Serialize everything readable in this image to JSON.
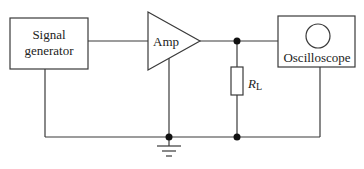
{
  "diagram": {
    "type": "circuit-block-diagram",
    "blocks": {
      "signal_generator": {
        "line1": "Signal",
        "line2": "generator"
      },
      "amplifier": {
        "label": "Amp"
      },
      "oscilloscope": {
        "label": "Oscilloscope"
      },
      "load_resistor": {
        "symbol": "R",
        "subscript": "L"
      }
    },
    "ground": {
      "icon": "ground-icon"
    },
    "colors": {
      "line": "#3a3a3a",
      "text": "#222222",
      "node": "#111111",
      "background": "#ffffff"
    }
  }
}
